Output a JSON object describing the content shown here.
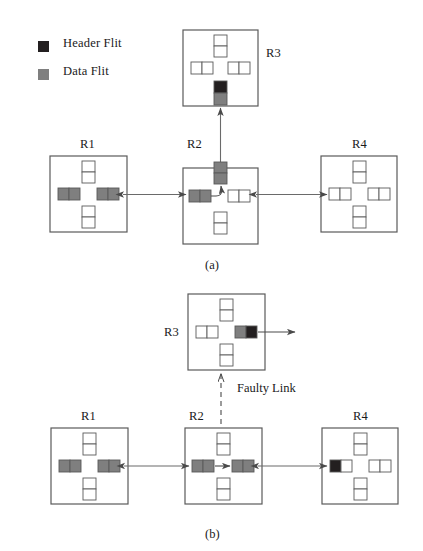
{
  "legend": {
    "items": [
      {
        "label": "Header Flit",
        "color": "#231f20",
        "swatch": "header-flit-swatch"
      },
      {
        "label": "Data Flit",
        "color": "#7f7f7f",
        "swatch": "data-flit-swatch"
      }
    ]
  },
  "colors": {
    "header_flit": "#231f20",
    "data_flit": "#7f7f7f",
    "empty_flit": "#ffffff",
    "stroke": "#5a5a5a",
    "arrow": "#4a4a4a",
    "text": "#1a1a1a"
  },
  "panels": [
    {
      "caption": "(a)",
      "name": "panel-a",
      "annotations": [],
      "routers": [
        {
          "id": "R1",
          "label": "R1",
          "label_pos": "top",
          "buffers": {
            "north": [
              "empty",
              "empty"
            ],
            "south": [
              "empty",
              "empty"
            ],
            "west": [
              "data",
              "data"
            ],
            "east": [
              "data",
              "data"
            ]
          }
        },
        {
          "id": "R2",
          "label": "R2",
          "label_pos": "top",
          "buffers": {
            "north": [
              "data",
              "data"
            ],
            "south": [
              "empty",
              "empty"
            ],
            "west": [
              "data",
              "data"
            ],
            "east": [
              "empty",
              "empty"
            ]
          },
          "internal_turn": "west-to-north"
        },
        {
          "id": "R3",
          "label": "R3",
          "label_pos": "right",
          "buffers": {
            "north": [
              "empty",
              "empty"
            ],
            "south": [
              "header",
              "data"
            ],
            "west": [
              "empty",
              "empty"
            ],
            "east": [
              "empty",
              "empty"
            ]
          }
        },
        {
          "id": "R4",
          "label": "R4",
          "label_pos": "top",
          "buffers": {
            "north": [
              "empty",
              "empty"
            ],
            "south": [
              "empty",
              "empty"
            ],
            "west": [
              "empty",
              "empty"
            ],
            "east": [
              "empty",
              "empty"
            ]
          }
        }
      ]
    },
    {
      "caption": "(b)",
      "name": "panel-b",
      "annotations": [
        {
          "text": "Faulty Link",
          "name": "faulty-link-label"
        }
      ],
      "routers": [
        {
          "id": "R1",
          "label": "R1",
          "label_pos": "top",
          "buffers": {
            "north": [
              "empty",
              "empty"
            ],
            "south": [
              "empty",
              "empty"
            ],
            "west": [
              "data",
              "data"
            ],
            "east": [
              "data",
              "data"
            ]
          }
        },
        {
          "id": "R2",
          "label": "R2",
          "label_pos": "top",
          "buffers": {
            "north": [
              "empty",
              "empty"
            ],
            "south": [
              "empty",
              "empty"
            ],
            "west": [
              "data",
              "data"
            ],
            "east": [
              "data",
              "data"
            ]
          },
          "internal_turn": "west-to-east"
        },
        {
          "id": "R3",
          "label": "R3",
          "label_pos": "left",
          "buffers": {
            "north": [
              "empty",
              "empty"
            ],
            "south": [
              "empty",
              "empty"
            ],
            "west": [
              "empty",
              "empty"
            ],
            "east": [
              "data",
              "header"
            ]
          }
        },
        {
          "id": "R4",
          "label": "R4",
          "label_pos": "top",
          "buffers": {
            "north": [
              "empty",
              "empty"
            ],
            "south": [
              "empty",
              "empty"
            ],
            "west": [
              "header",
              "empty"
            ],
            "east": [
              "empty",
              "empty"
            ]
          }
        }
      ]
    }
  ]
}
